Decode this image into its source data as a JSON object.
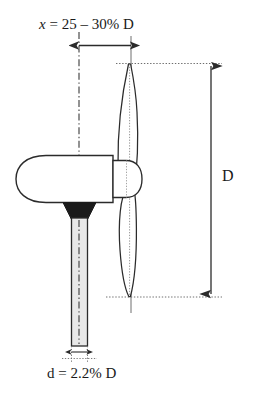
{
  "diagram": {
    "colors": {
      "stroke": "#2b2b2b",
      "fill_dark": "#1a1a1a",
      "fill_light": "#e8e8e8",
      "background": "#ffffff",
      "dotted": "#6e6e6e"
    },
    "annotations": {
      "offset_label_var": "x",
      "offset_label_rest": " = 25 – 30% D",
      "offset_label_full": "x = 25 – 30% D",
      "diameter_label": "D",
      "tower_label": "d = 2.2% D"
    },
    "parts": {
      "nacelle": "nacelle",
      "hub": "hub",
      "blade": "rotor-blade",
      "tower": "tower",
      "yaw_bearing": "yaw-bearing",
      "tower_centerline": "tower-centerline",
      "rotor_plane": "rotor-plane-line"
    },
    "dimensions": {
      "offset_arrow": "horizontal-double-arrow",
      "diameter_arrow": "vertical-double-arrow",
      "tower_arrow": "small-double-arrow"
    }
  }
}
